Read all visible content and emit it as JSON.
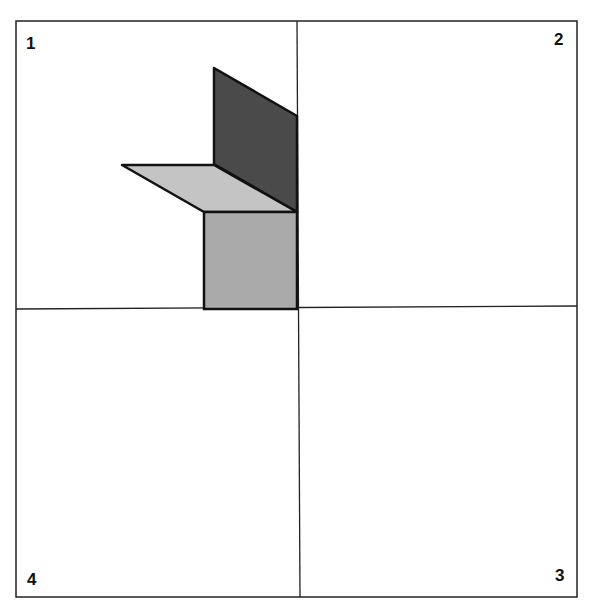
{
  "quadrants": {
    "q1": {
      "label": "1"
    },
    "q2": {
      "label": "2"
    },
    "q3": {
      "label": "3"
    },
    "q4": {
      "label": "4"
    }
  },
  "colors": {
    "dark_panel": "#4a4a4a",
    "top_face": "#c4c4c4",
    "front_face": "#aaaaaa",
    "stroke": "#111111"
  }
}
